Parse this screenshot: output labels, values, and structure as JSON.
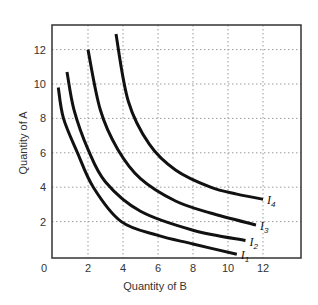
{
  "chart_data": {
    "type": "line",
    "title": "",
    "xlabel": "Quantity of B",
    "ylabel": "Quantity of A",
    "xlim": [
      0,
      14
    ],
    "ylim": [
      0,
      14
    ],
    "x_ticks": [
      0,
      2,
      4,
      6,
      8,
      10,
      12
    ],
    "y_ticks": [
      2,
      4,
      6,
      8,
      10,
      12
    ],
    "x_tick_labels": [
      "0",
      "2",
      "4",
      "6",
      "8",
      "10",
      "12"
    ],
    "y_tick_labels": [
      "2",
      "4",
      "6",
      "8",
      "10",
      "12"
    ],
    "grid": "dotted",
    "legend": "inline-right-end-labels",
    "series": [
      {
        "name": "I1",
        "label_main": "I",
        "label_sub": "1",
        "points": [
          [
            0.3,
            9.8
          ],
          [
            0.6,
            8.0
          ],
          [
            1.4,
            6.0
          ],
          [
            2.3,
            4.0
          ],
          [
            3.9,
            2.0
          ],
          [
            6.0,
            1.2
          ],
          [
            8.0,
            0.7
          ],
          [
            10.5,
            0.1
          ]
        ]
      },
      {
        "name": "I2",
        "label_main": "I",
        "label_sub": "2",
        "points": [
          [
            0.8,
            10.7
          ],
          [
            1.2,
            8.5
          ],
          [
            2.0,
            6.2
          ],
          [
            3.0,
            4.3
          ],
          [
            5.0,
            2.6
          ],
          [
            8.0,
            1.5
          ],
          [
            11.0,
            0.9
          ]
        ]
      },
      {
        "name": "I3",
        "label_main": "I",
        "label_sub": "3",
        "points": [
          [
            2.0,
            12.0
          ],
          [
            2.7,
            8.5
          ],
          [
            3.7,
            6.2
          ],
          [
            5.0,
            4.5
          ],
          [
            7.0,
            3.2
          ],
          [
            9.0,
            2.5
          ],
          [
            11.6,
            1.8
          ]
        ]
      },
      {
        "name": "I4",
        "label_main": "I",
        "label_sub": "4",
        "points": [
          [
            3.6,
            12.9
          ],
          [
            4.3,
            9.0
          ],
          [
            5.5,
            6.5
          ],
          [
            7.0,
            5.0
          ],
          [
            9.0,
            4.0
          ],
          [
            10.5,
            3.6
          ],
          [
            12.0,
            3.3
          ]
        ]
      }
    ],
    "colors": {
      "curve": "#111111",
      "frame": "#333333",
      "grid": "#9a9a9a"
    }
  }
}
